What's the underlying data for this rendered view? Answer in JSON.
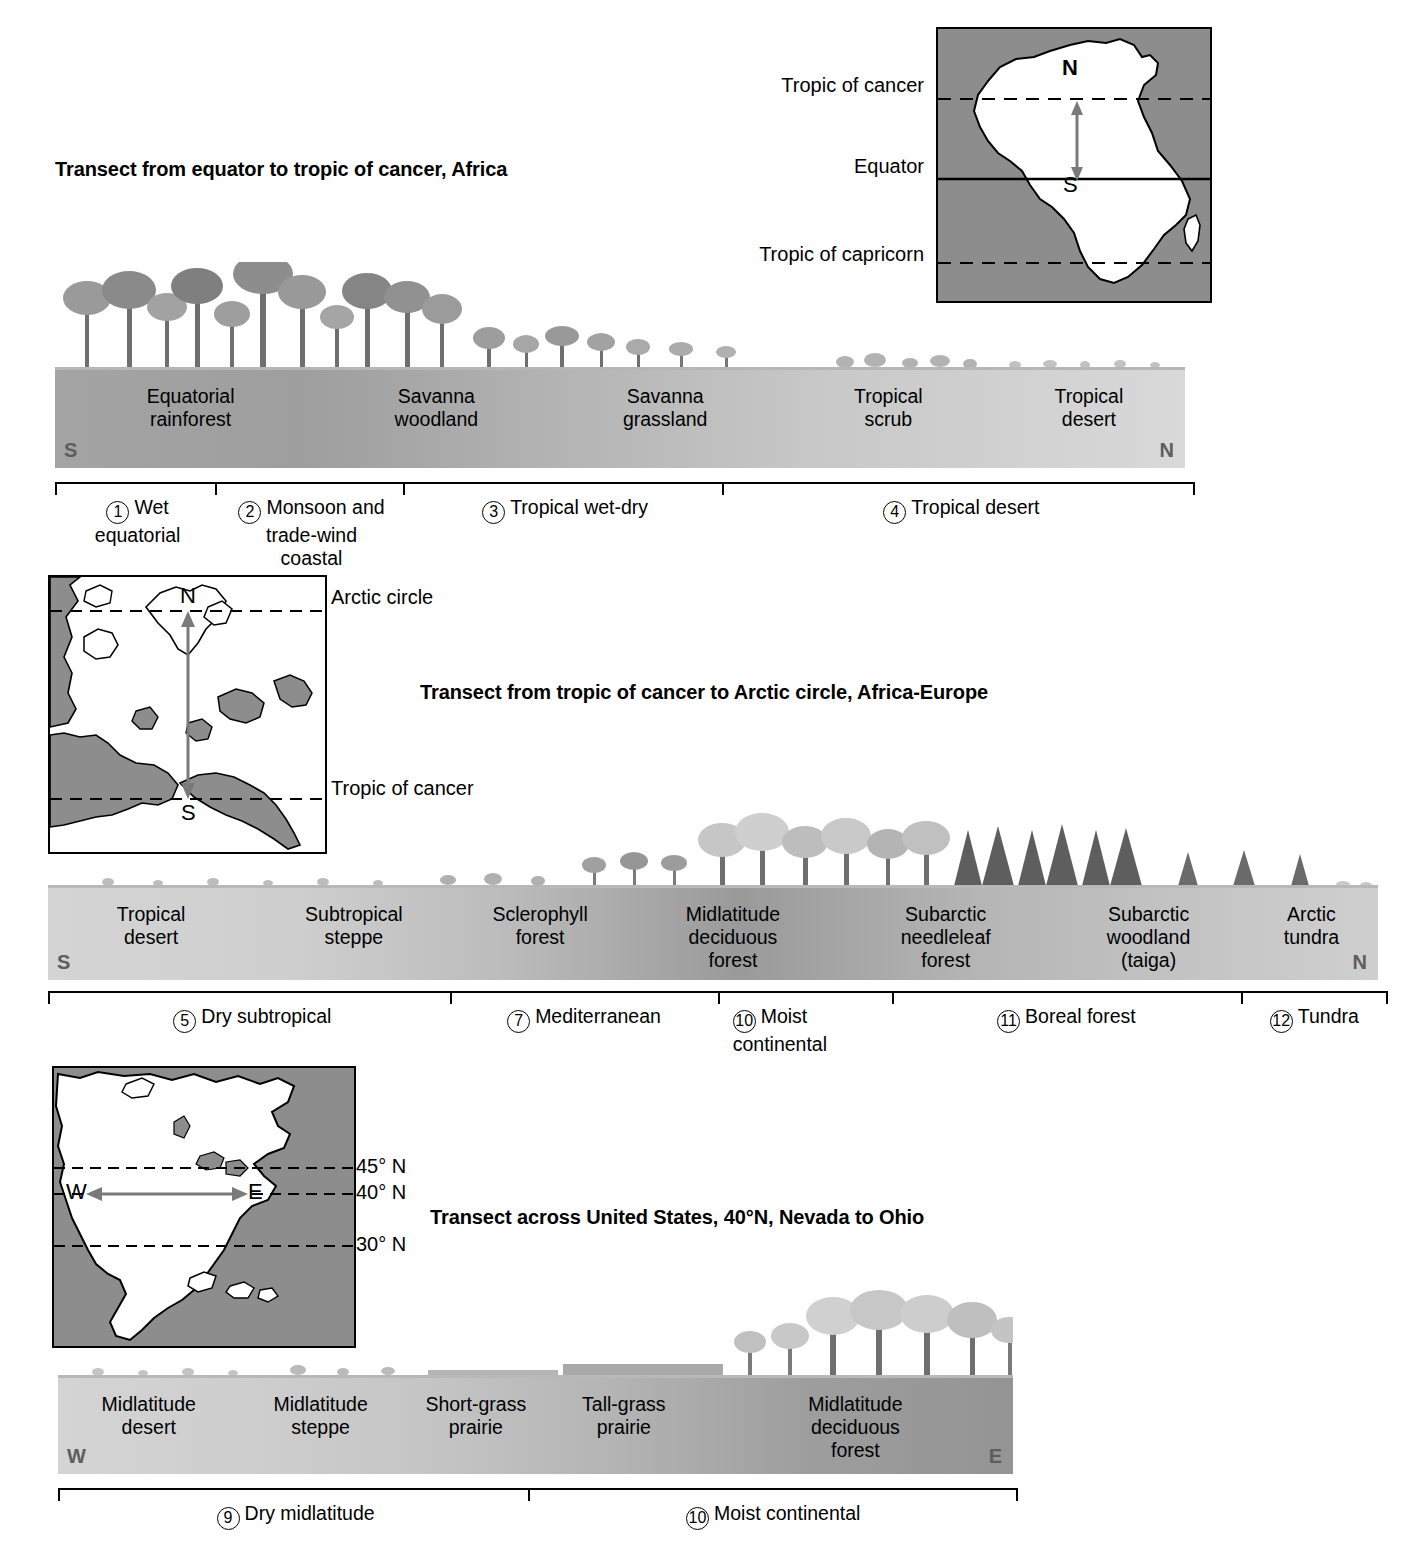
{
  "transects": [
    {
      "id": "africa",
      "title": "Transect from equator to tropic of cancer, Africa",
      "left_marker": "S",
      "right_marker": "N",
      "zones": [
        {
          "line1": "Equatorial",
          "line2": "rainforest"
        },
        {
          "line1": "Savanna",
          "line2": "woodland"
        },
        {
          "line1": "Savanna",
          "line2": "grassland"
        },
        {
          "line1": "Tropical",
          "line2": "scrub"
        },
        {
          "line1": "Tropical",
          "line2": "desert"
        }
      ],
      "climates": [
        {
          "number": "1",
          "line1": "Wet",
          "line2": "equatorial",
          "line3": ""
        },
        {
          "number": "2",
          "line1": "Monsoon and",
          "line2": "trade-wind",
          "line3": "coastal"
        },
        {
          "number": "3",
          "line1": "Tropical wet-dry",
          "line2": "",
          "line3": ""
        },
        {
          "number": "4",
          "line1": "Tropical desert",
          "line2": "",
          "line3": ""
        }
      ],
      "map": {
        "name": "africa-map",
        "labels": [
          {
            "text": "Tropic of cancer"
          },
          {
            "text": "Equator"
          },
          {
            "text": "Tropic of capricorn"
          }
        ],
        "arrow_top": "N",
        "arrow_bottom": "S"
      }
    },
    {
      "id": "africa-europe",
      "title": "Transect from tropic of cancer to Arctic circle, Africa-Europe",
      "left_marker": "S",
      "right_marker": "N",
      "zones": [
        {
          "line1": "Tropical",
          "line2": "desert",
          "line3": ""
        },
        {
          "line1": "Subtropical",
          "line2": "steppe",
          "line3": ""
        },
        {
          "line1": "Sclerophyll",
          "line2": "forest",
          "line3": ""
        },
        {
          "line1": "Midlatitude",
          "line2": "deciduous",
          "line3": "forest"
        },
        {
          "line1": "Subarctic",
          "line2": "needleleaf",
          "line3": "forest"
        },
        {
          "line1": "Subarctic",
          "line2": "woodland",
          "line3": "(taiga)"
        },
        {
          "line1": "Arctic",
          "line2": "tundra",
          "line3": ""
        }
      ],
      "climates": [
        {
          "number": "5",
          "line1": "Dry subtropical",
          "line2": ""
        },
        {
          "number": "7",
          "line1": "Mediterranean",
          "line2": ""
        },
        {
          "number": "10",
          "line1": "Moist",
          "line2": "continental"
        },
        {
          "number": "11",
          "line1": "Boreal forest",
          "line2": ""
        },
        {
          "number": "12",
          "line1": "Tundra",
          "line2": ""
        }
      ],
      "map": {
        "name": "europe-map",
        "labels": [
          {
            "text": "Arctic circle"
          },
          {
            "text": "Tropic of cancer"
          }
        ],
        "arrow_top": "N",
        "arrow_bottom": "S"
      }
    },
    {
      "id": "united-states",
      "title": "Transect across United States, 40°N, Nevada to Ohio",
      "left_marker": "W",
      "right_marker": "E",
      "zones": [
        {
          "line1": "Midlatitude",
          "line2": "desert",
          "line3": ""
        },
        {
          "line1": "Midlatitude",
          "line2": "steppe",
          "line3": ""
        },
        {
          "line1": "Short-grass",
          "line2": "prairie",
          "line3": ""
        },
        {
          "line1": "Tall-grass",
          "line2": "prairie",
          "line3": ""
        },
        {
          "line1": "Midlatitude",
          "line2": "deciduous",
          "line3": "forest"
        }
      ],
      "climates": [
        {
          "number": "9",
          "line1": "Dry midlatitude",
          "line2": ""
        },
        {
          "number": "10",
          "line1": "Moist continental",
          "line2": ""
        }
      ],
      "map": {
        "name": "north-america-map",
        "labels": [
          {
            "text": "45° N"
          },
          {
            "text": "40° N"
          },
          {
            "text": "30° N"
          }
        ],
        "arrow_left": "W",
        "arrow_right": "E"
      }
    }
  ],
  "colors": {
    "map_ocean": "#8d8d8d",
    "map_land": "#ffffff",
    "band_dark": "#a8a8a8",
    "band_light": "#d8d8d8",
    "corner_marker": "#5d5d5d",
    "line": "#000000"
  }
}
